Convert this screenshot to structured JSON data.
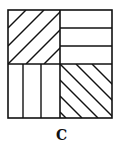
{
  "figure": {
    "label": "C",
    "stroke_color": "#111111",
    "quadrants": [
      {
        "position": "top-left",
        "pattern": "diagonal lines (bottom-left to top-right)"
      },
      {
        "position": "top-right",
        "pattern": "horizontal lines"
      },
      {
        "position": "bottom-left",
        "pattern": "vertical lines"
      },
      {
        "position": "bottom-right",
        "pattern": "diagonal lines (top-left to bottom-right)"
      }
    ]
  }
}
